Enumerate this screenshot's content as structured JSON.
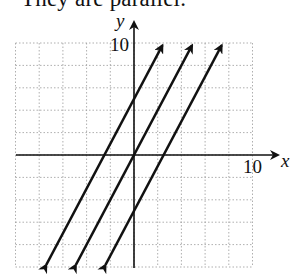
{
  "caption": "They are parallel.",
  "chart_data": {
    "type": "line",
    "title": "They are parallel.",
    "xlabel": "x",
    "ylabel": "y",
    "xlim": [
      -10,
      10
    ],
    "ylim": [
      -10,
      10
    ],
    "grid": true,
    "grid_step": 2,
    "tick_labels": {
      "x": "10",
      "y": "10"
    },
    "series": [
      {
        "name": "y = 2x + 5",
        "slope": 2,
        "intercept": 5,
        "x": [
          -7.5,
          2.5
        ],
        "y": [
          -10,
          10
        ]
      },
      {
        "name": "y = 2x",
        "slope": 2,
        "intercept": 0,
        "x": [
          -5,
          5
        ],
        "y": [
          -10,
          10
        ]
      },
      {
        "name": "y = 2x - 5",
        "slope": 2,
        "intercept": -5,
        "x": [
          -2.5,
          7.5
        ],
        "y": [
          -10,
          10
        ]
      }
    ],
    "legend": []
  },
  "axes": {
    "x_label": "x",
    "y_label": "y",
    "x_tick": "10",
    "y_tick": "10"
  },
  "colors": {
    "line": "#111111",
    "grid": "#9a9a9a",
    "axis": "#111111"
  }
}
